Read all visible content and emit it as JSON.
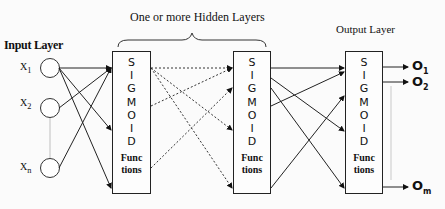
{
  "diagram": {
    "type": "feedforward-neural-network",
    "hidden_title": "One or more Hidden Layers",
    "input_layer": {
      "label": "Input Layer",
      "nodes": [
        {
          "label": "X",
          "sub": "1"
        },
        {
          "label": "X",
          "sub": "2"
        },
        {
          "label": "X",
          "sub": "n"
        }
      ]
    },
    "hidden_layers": [
      {
        "letters": [
          "S",
          "I",
          "G",
          "M",
          "O",
          "I",
          "D"
        ],
        "func_line1": "Func",
        "func_line2": "tions"
      },
      {
        "letters": [
          "S",
          "I",
          "G",
          "M",
          "O",
          "I",
          "D"
        ],
        "func_line1": "Func",
        "func_line2": "tions"
      }
    ],
    "output_layer": {
      "label": "Output Layer",
      "letters": [
        "S",
        "I",
        "G",
        "M",
        "O",
        "I",
        "D"
      ],
      "func_line1": "Func",
      "func_line2": "tions",
      "outputs": [
        {
          "label": "O",
          "sub": "1"
        },
        {
          "label": "O",
          "sub": "2"
        },
        {
          "label": "O",
          "sub": "m"
        }
      ]
    }
  }
}
